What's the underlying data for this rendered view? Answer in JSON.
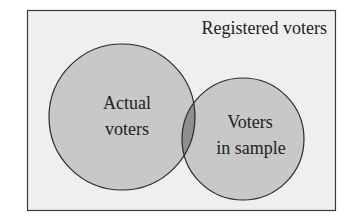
{
  "diagram": {
    "type": "venn",
    "universe_label": "Registered voters",
    "sets": [
      {
        "label_line1": "Actual",
        "label_line2": "voters"
      },
      {
        "label_line1": "Voters",
        "label_line2": "in sample"
      }
    ],
    "colors": {
      "background": "#efefef",
      "circle_fill": "#c8c8c8",
      "overlap_fill": "#8f8f8f",
      "stroke": "#2a2a2a"
    }
  }
}
